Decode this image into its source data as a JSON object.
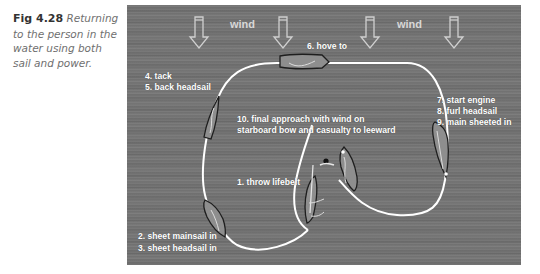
{
  "caption": {
    "figure_number": "Fig 4.28",
    "text": " Returning to the person in the water using both sail and power."
  },
  "diagram": {
    "wind_labels": [
      "wind",
      "wind"
    ],
    "steps": {
      "tack": "4. tack",
      "back_headsail": "5. back headsail",
      "hove_to": "6. hove to",
      "start_engine": "7. start engine",
      "furl_headsail": "8. furl headsail",
      "main_sheeted": "9. main sheeted in",
      "final_approach_1": "10. final approach with wind on",
      "final_approach_2": "starboard bow and casualty to leeward",
      "throw_lifebelt": "1. throw lifebelt",
      "sheet_mainsail": "2. sheet mainsail in",
      "sheet_headsail": "3. sheet headsail in"
    },
    "colors": {
      "water": "#727272",
      "track": "#ffffff",
      "hull": "#8e8e8e",
      "hull_outline": "#1e1e1e",
      "wind_arrow": "#d0d0d0"
    }
  }
}
